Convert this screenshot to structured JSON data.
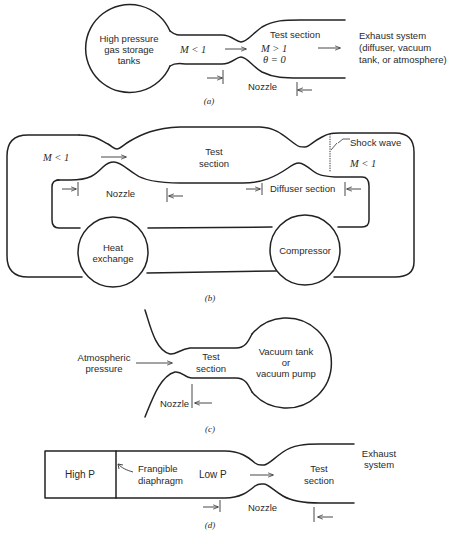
{
  "figure": {
    "panels": [
      {
        "id": "a",
        "caption": "(a)",
        "tank_label": [
          "High pressure",
          "gas storage",
          "tanks"
        ],
        "upstream_mach": "M < 1",
        "test_section_label": "Test section",
        "test_mach": "M > 1",
        "theta": "θ = 0",
        "exhaust_label": [
          "Exhaust system",
          "(diffuser, vacuum",
          "tank, or atmosphere)"
        ],
        "nozzle_label": "Nozzle"
      },
      {
        "id": "b",
        "caption": "(b)",
        "upstream_mach": "M < 1",
        "test_section_label": [
          "Test",
          "section"
        ],
        "shock_label": "Shock wave",
        "downstream_mach": "M < 1",
        "nozzle_label": "Nozzle",
        "diffuser_label": "Diffuser section",
        "heat_exchanger_label": [
          "Heat",
          "exchange"
        ],
        "compressor_label": "Compressor"
      },
      {
        "id": "c",
        "caption": "(c)",
        "inlet_label": [
          "Atmospheric",
          "pressure"
        ],
        "test_section_label": [
          "Test",
          "section"
        ],
        "vacuum_label": [
          "Vacuum tank",
          "or",
          "vacuum pump"
        ],
        "nozzle_label": "Nozzle"
      },
      {
        "id": "d",
        "caption": "(d)",
        "high_p_label": "High P",
        "diaphragm_label": [
          "Frangible",
          "diaphragm"
        ],
        "low_p_label": "Low P",
        "test_section_label": [
          "Test",
          "section"
        ],
        "exhaust_label": [
          "Exhaust",
          "system"
        ],
        "nozzle_label": "Nozzle"
      }
    ]
  },
  "colors": {
    "background": "#ffffff",
    "line": "#222222",
    "text": "#2a2a2a"
  }
}
